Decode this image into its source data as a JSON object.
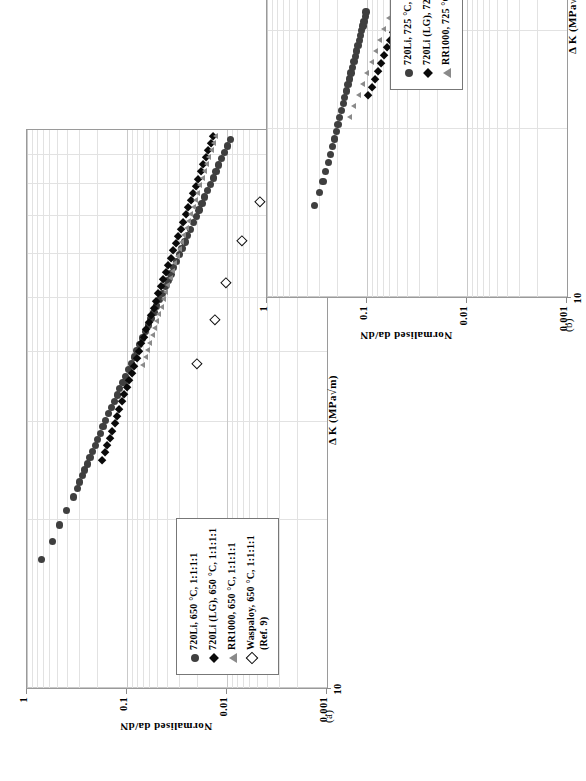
{
  "figure": {
    "panels": [
      "(a)",
      "(b)"
    ]
  },
  "chart_data": [
    {
      "id": "a",
      "type": "scatter",
      "panel_label": "(a)",
      "title": "",
      "xlabel": "Δ K (MPa√m)",
      "ylabel": "Normalised da/dN",
      "xscale": "log",
      "yscale": "log",
      "xlim": [
        10,
        100
      ],
      "ylim": [
        0.001,
        1
      ],
      "xticks": [
        "10",
        "100"
      ],
      "yticks": [
        "1",
        "0.1",
        "0.01",
        "0.001"
      ],
      "grid": true,
      "legend_position": "lower-left",
      "series": [
        {
          "name": "720Li, 650 °C, 1:1:1:1",
          "marker": "filled-circle",
          "color": "#3f3f3f",
          "points": [
            [
              17.0,
              0.72
            ],
            [
              18.3,
              0.56
            ],
            [
              19.6,
              0.47
            ],
            [
              20.8,
              0.4
            ],
            [
              22.0,
              0.345
            ],
            [
              22.8,
              0.315
            ],
            [
              23.4,
              0.3
            ],
            [
              24.0,
              0.28
            ],
            [
              24.6,
              0.265
            ],
            [
              25.2,
              0.25
            ],
            [
              25.9,
              0.235
            ],
            [
              26.5,
              0.222
            ],
            [
              27.2,
              0.208
            ],
            [
              27.9,
              0.196
            ],
            [
              28.6,
              0.185
            ],
            [
              29.4,
              0.174
            ],
            [
              30.2,
              0.163
            ],
            [
              31.0,
              0.152
            ],
            [
              31.8,
              0.143
            ],
            [
              32.6,
              0.134
            ],
            [
              33.5,
              0.125
            ],
            [
              34.4,
              0.118
            ],
            [
              35.3,
              0.11
            ],
            [
              36.2,
              0.103
            ],
            [
              37.2,
              0.0965
            ],
            [
              38.2,
              0.0905
            ],
            [
              39.2,
              0.0848
            ],
            [
              40.2,
              0.0795
            ],
            [
              41.3,
              0.0745
            ],
            [
              42.4,
              0.0698
            ],
            [
              43.5,
              0.0654
            ],
            [
              44.7,
              0.0613
            ],
            [
              45.9,
              0.0574
            ],
            [
              47.1,
              0.0538
            ],
            [
              48.4,
              0.0504
            ],
            [
              49.7,
              0.0472
            ],
            [
              51.0,
              0.0443
            ],
            [
              52.4,
              0.0415
            ],
            [
              53.8,
              0.0389
            ],
            [
              55.2,
              0.0364
            ],
            [
              56.7,
              0.0341
            ],
            [
              58.2,
              0.032
            ],
            [
              59.8,
              0.03
            ],
            [
              61.4,
              0.0281
            ],
            [
              63.0,
              0.0263
            ],
            [
              64.7,
              0.0247
            ],
            [
              66.4,
              0.0231
            ],
            [
              68.2,
              0.0217
            ],
            [
              70.0,
              0.0203
            ],
            [
              71.9,
              0.019
            ],
            [
              73.8,
              0.0178
            ],
            [
              75.8,
              0.0167
            ],
            [
              77.8,
              0.0157
            ],
            [
              79.9,
              0.0147
            ],
            [
              82.0,
              0.0137
            ],
            [
              84.2,
              0.0129
            ],
            [
              86.5,
              0.0121
            ],
            [
              88.8,
              0.0113
            ],
            [
              91.2,
              0.0106
            ],
            [
              93.6,
              0.0099
            ],
            [
              96.1,
              0.0093
            ]
          ]
        },
        {
          "name": "720Li (LG), 650 °C, 1:1:1:1",
          "marker": "filled-diamond",
          "color": "#0a0a0a",
          "points": [
            [
              25.6,
              0.178
            ],
            [
              26.4,
              0.168
            ],
            [
              27.2,
              0.159
            ],
            [
              28.0,
              0.15
            ],
            [
              28.9,
              0.142
            ],
            [
              29.8,
              0.134
            ],
            [
              30.7,
              0.127
            ],
            [
              31.6,
              0.12
            ],
            [
              32.6,
              0.113
            ],
            [
              33.6,
              0.107
            ],
            [
              34.6,
              0.101
            ],
            [
              35.6,
              0.0955
            ],
            [
              36.7,
              0.0903
            ],
            [
              37.8,
              0.0853
            ],
            [
              39.0,
              0.0807
            ],
            [
              40.2,
              0.0763
            ],
            [
              41.4,
              0.0721
            ],
            [
              42.6,
              0.0682
            ],
            [
              43.9,
              0.0645
            ],
            [
              45.2,
              0.061
            ],
            [
              46.6,
              0.0576
            ],
            [
              48.0,
              0.0545
            ],
            [
              49.4,
              0.0515
            ],
            [
              50.9,
              0.0487
            ],
            [
              52.4,
              0.046
            ],
            [
              54.0,
              0.0435
            ],
            [
              55.6,
              0.0411
            ],
            [
              57.3,
              0.0388
            ],
            [
              59.0,
              0.0367
            ],
            [
              60.8,
              0.0347
            ],
            [
              62.6,
              0.0327
            ],
            [
              64.5,
              0.0309
            ],
            [
              66.4,
              0.0292
            ],
            [
              68.4,
              0.0276
            ],
            [
              70.5,
              0.0261
            ],
            [
              72.6,
              0.0246
            ],
            [
              74.8,
              0.0232
            ],
            [
              77.0,
              0.0219
            ],
            [
              79.3,
              0.0207
            ],
            [
              81.7,
              0.0195
            ],
            [
              84.2,
              0.0184
            ],
            [
              86.7,
              0.0174
            ],
            [
              89.3,
              0.0164
            ],
            [
              92.0,
              0.0155
            ],
            [
              94.8,
              0.0146
            ],
            [
              97.6,
              0.0138
            ]
          ]
        },
        {
          "name": "RR1000, 650 °C, 1:1:1:1",
          "marker": "filled-triangle",
          "color": "#8a8a8a",
          "points": [
            [
              38.0,
              0.069
            ],
            [
              39.2,
              0.0655
            ],
            [
              40.4,
              0.0622
            ],
            [
              41.6,
              0.059
            ],
            [
              42.9,
              0.056
            ],
            [
              44.2,
              0.0532
            ],
            [
              45.5,
              0.0505
            ],
            [
              46.9,
              0.0479
            ],
            [
              48.3,
              0.0455
            ],
            [
              49.8,
              0.0432
            ],
            [
              51.3,
              0.041
            ],
            [
              52.8,
              0.0389
            ],
            [
              54.4,
              0.0369
            ],
            [
              56.0,
              0.035
            ],
            [
              57.7,
              0.0332
            ],
            [
              59.4,
              0.0315
            ],
            [
              61.2,
              0.0299
            ],
            [
              63.0,
              0.0284
            ],
            [
              64.9,
              0.0269
            ],
            [
              66.8,
              0.0255
            ],
            [
              68.8,
              0.0242
            ],
            [
              70.8,
              0.023
            ],
            [
              72.9,
              0.0218
            ],
            [
              75.1,
              0.0207
            ],
            [
              77.3,
              0.0196
            ],
            [
              79.6,
              0.0186
            ],
            [
              82.0,
              0.0176
            ],
            [
              84.4,
              0.0167
            ],
            [
              86.9,
              0.0159
            ],
            [
              89.5,
              0.0151
            ],
            [
              92.1,
              0.0143
            ],
            [
              94.8,
              0.0136
            ],
            [
              97.6,
              0.0129
            ]
          ]
        },
        {
          "name": "Waspaloy, 650 °C, 1:1:1:1",
          "name_sub": "(Ref. 9)",
          "marker": "open-diamond",
          "color": "#111111",
          "points": [
            [
              38.0,
              0.0205
            ],
            [
              45.5,
              0.0135
            ],
            [
              53.0,
              0.0104
            ],
            [
              63.0,
              0.0073
            ],
            [
              74.0,
              0.0048
            ],
            [
              88.0,
              0.0033
            ]
          ]
        }
      ]
    },
    {
      "id": "b",
      "type": "scatter",
      "panel_label": "(b)",
      "title": "",
      "xlabel": "Δ K (MPa√m)",
      "ylabel": "Normalised da/dN",
      "xscale": "log",
      "yscale": "log",
      "xlim": [
        10,
        100
      ],
      "ylim": [
        0.001,
        1
      ],
      "xticks": [
        "10",
        "100"
      ],
      "yticks": [
        "1",
        "0.1",
        "0.01",
        "0.001"
      ],
      "grid": true,
      "legend_position": "lower-right",
      "series": [
        {
          "name": "720Li, 725 °C, 1:1:1:1",
          "marker": "filled-circle",
          "color": "#3f3f3f",
          "points": [
            [
              14.6,
              0.335
            ],
            [
              15.4,
              0.3
            ],
            [
              16.1,
              0.276
            ],
            [
              16.8,
              0.258
            ],
            [
              17.4,
              0.244
            ],
            [
              18.0,
              0.232
            ],
            [
              18.6,
              0.221
            ],
            [
              19.2,
              0.212
            ],
            [
              19.8,
              0.203
            ],
            [
              20.4,
              0.195
            ],
            [
              21.0,
              0.187
            ],
            [
              21.6,
              0.18
            ],
            [
              22.2,
              0.173
            ],
            [
              22.8,
              0.167
            ],
            [
              23.4,
              0.161
            ],
            [
              24.0,
              0.155
            ],
            [
              24.6,
              0.15
            ],
            [
              25.2,
              0.145
            ],
            [
              25.8,
              0.14
            ],
            [
              26.4,
              0.135
            ],
            [
              27.0,
              0.131
            ],
            [
              27.6,
              0.127
            ],
            [
              28.2,
              0.123
            ],
            [
              28.8,
              0.119
            ],
            [
              29.4,
              0.116
            ],
            [
              30.0,
              0.113
            ],
            [
              30.6,
              0.11
            ],
            [
              31.2,
              0.107
            ],
            [
              31.8,
              0.104
            ],
            [
              32.4,
              0.102
            ]
          ]
        },
        {
          "name": "720Li (LG), 725 °C, 1:1:1:1",
          "marker": "filled-diamond",
          "color": "#0a0a0a",
          "points": [
            [
              23.0,
              0.0975
            ],
            [
              23.8,
              0.0905
            ],
            [
              24.6,
              0.084
            ],
            [
              25.4,
              0.0782
            ],
            [
              26.2,
              0.0728
            ],
            [
              27.1,
              0.0679
            ],
            [
              28.0,
              0.0633
            ],
            [
              28.9,
              0.0591
            ],
            [
              29.8,
              0.0552
            ],
            [
              30.8,
              0.0516
            ],
            [
              31.8,
              0.0482
            ],
            [
              32.8,
              0.0451
            ],
            [
              33.9,
              0.0422
            ],
            [
              35.0,
              0.0395
            ],
            [
              36.1,
              0.037
            ],
            [
              37.3,
              0.0347
            ],
            [
              38.5,
              0.0325
            ],
            [
              39.7,
              0.0305
            ],
            [
              41.0,
              0.0286
            ],
            [
              42.3,
              0.0269
            ],
            [
              43.7,
              0.0252
            ],
            [
              45.1,
              0.0237
            ],
            [
              46.6,
              0.0223
            ],
            [
              48.1,
              0.0209
            ],
            [
              49.7,
              0.0197
            ],
            [
              51.3,
              0.0185
            ],
            [
              53.0,
              0.0174
            ],
            [
              54.7,
              0.0164
            ],
            [
              56.5,
              0.0154
            ],
            [
              58.3,
              0.0145
            ],
            [
              60.2,
              0.0137
            ],
            [
              62.2,
              0.0129
            ],
            [
              64.2,
              0.0121
            ],
            [
              66.3,
              0.0114
            ],
            [
              68.5,
              0.0108
            ],
            [
              70.7,
              0.0101
            ],
            [
              73.0,
              0.0096
            ],
            [
              75.4,
              0.009
            ],
            [
              77.9,
              0.0085
            ],
            [
              80.4,
              0.008
            ],
            [
              83.0,
              0.0076
            ],
            [
              85.7,
              0.0072
            ],
            [
              88.5,
              0.0068
            ],
            [
              91.4,
              0.0064
            ]
          ]
        },
        {
          "name": "RR1000, 725 °C, 1:1:1:1",
          "marker": "filled-triangle",
          "color": "#8a8a8a",
          "points": [
            [
              21.0,
              0.15
            ],
            [
              22.0,
              0.135
            ],
            [
              23.0,
              0.122
            ],
            [
              24.1,
              0.11
            ],
            [
              25.2,
              0.1
            ],
            [
              26.4,
              0.0905
            ],
            [
              27.6,
              0.082
            ],
            [
              28.9,
              0.0745
            ],
            [
              30.2,
              0.0676
            ],
            [
              31.6,
              0.0614
            ],
            [
              33.0,
              0.0558
            ],
            [
              34.5,
              0.0507
            ],
            [
              36.1,
              0.0461
            ],
            [
              37.7,
              0.0419
            ],
            [
              39.4,
              0.0381
            ],
            [
              41.2,
              0.0347
            ],
            [
              43.1,
              0.0315
            ],
            [
              45.0,
              0.0287
            ],
            [
              47.0,
              0.0261
            ],
            [
              49.1,
              0.0238
            ],
            [
              51.3,
              0.0216
            ],
            [
              53.6,
              0.0197
            ],
            [
              56.0,
              0.0179
            ],
            [
              58.5,
              0.0164
            ],
            [
              61.0,
              0.0149
            ],
            [
              63.7,
              0.0136
            ],
            [
              66.5,
              0.0124
            ],
            [
              69.4,
              0.0113
            ],
            [
              72.4,
              0.0103
            ],
            [
              75.6,
              0.0095
            ]
          ]
        }
      ]
    }
  ]
}
